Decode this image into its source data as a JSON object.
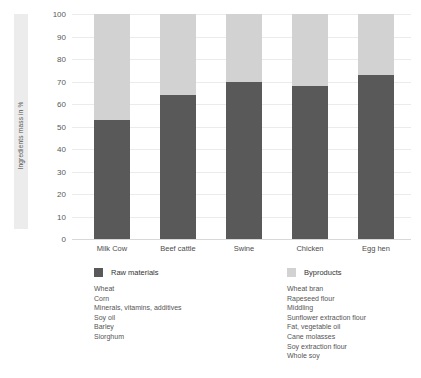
{
  "chart_data": {
    "type": "bar",
    "title": "",
    "subtitle": "",
    "xlabel": "",
    "ylabel": "Ingredients mass in %",
    "ylim": [
      0,
      100
    ],
    "yticks": [
      100,
      90,
      80,
      70,
      60,
      50,
      40,
      30,
      20,
      10,
      0
    ],
    "grid": true,
    "stacked": true,
    "legend_position": "bottom",
    "categories": [
      "Milk Cow",
      "Beef cattle",
      "Swine",
      "Chicken",
      "Egg hen"
    ],
    "series": [
      {
        "name": "Raw materials",
        "color": "#595959",
        "values": [
          53,
          64,
          70,
          68,
          73
        ]
      },
      {
        "name": "Byproducts",
        "color": "#d2d2d2",
        "values": [
          47,
          36,
          30,
          32,
          27
        ]
      }
    ]
  },
  "axis": {
    "y_title": "Ingredients mass in %",
    "y_ticks": [
      "100",
      "90",
      "80",
      "70",
      "60",
      "50",
      "40",
      "30",
      "20",
      "10",
      "0"
    ],
    "x_ticks": [
      "Milk Cow",
      "Beef cattle",
      "Swine",
      "Chicken",
      "Egg hen"
    ]
  },
  "legend": {
    "columns": [
      {
        "title": "Raw materials",
        "swatch_color": "#595959",
        "items": [
          "Wheat",
          "Corn",
          "Minerals, vitamins, additives",
          "Soy oil",
          "Barley",
          "Siorghum"
        ]
      },
      {
        "title": "Byproducts",
        "swatch_color": "#d2d2d2",
        "items": [
          "Wheat bran",
          "Rapeseed flour",
          "Middling",
          "Sunflower extraction flour",
          "Fat, vegetable oil",
          "Cane molasses",
          "Soy extraction flour",
          "Whole soy"
        ]
      }
    ]
  }
}
